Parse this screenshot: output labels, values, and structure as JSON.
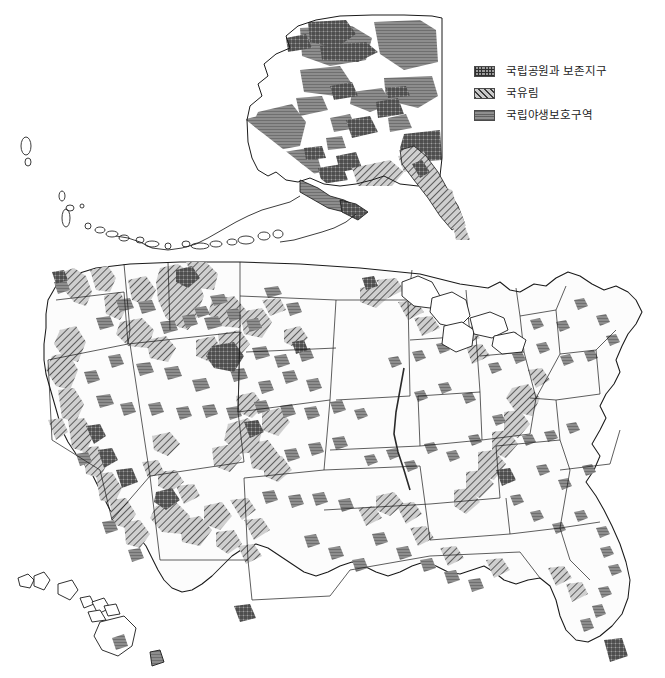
{
  "map": {
    "title": "United States Federal Protected Lands",
    "projection": "albers-conic",
    "background_color": "#ffffff",
    "outline_color": "#1a1a1a",
    "insets": [
      {
        "name": "alaska",
        "label": "Alaska"
      },
      {
        "name": "hawaii",
        "label": "Hawaii"
      },
      {
        "name": "conus",
        "label": "Contiguous United States"
      }
    ]
  },
  "legend": {
    "position": "top-right",
    "items": [
      {
        "key": "national-parks",
        "label": "국립공원과 보존지구",
        "pattern": "crosshatch",
        "swatch_class": "sw-park",
        "fill_color": "#9a9a9a",
        "line_color": "#2e2e2e"
      },
      {
        "key": "national-forests",
        "label": "국유림",
        "pattern": "diagonal-hatch",
        "swatch_class": "sw-forest",
        "fill_color": "#c9c9c9",
        "line_color": "#3a3a3a"
      },
      {
        "key": "national-wildlife-refuges",
        "label": "국립야생보호구역",
        "pattern": "solid-gray",
        "swatch_class": "sw-refuge",
        "fill_color": "#8f8f8f",
        "line_color": "#3c3c3c"
      }
    ]
  },
  "regions": {
    "alaska": {
      "protected_share": "high",
      "dominant_pattern": "solid-gray",
      "notes": "Large refuge and park blocks across interior and north; forest hatching along southeast panhandle."
    },
    "west": {
      "protected_share": "high",
      "dominant_pattern": "diagonal-hatch",
      "notes": "Continuous national forest belts along Cascades, Sierra Nevada and Rocky Mountains."
    },
    "midwest": {
      "protected_share": "low",
      "dominant_pattern": "solid-gray",
      "notes": "Scattered small refuges across the plains; forests near the Great Lakes."
    },
    "east": {
      "protected_share": "moderate",
      "dominant_pattern": "diagonal-hatch",
      "notes": "Appalachian forest corridor from Pennsylvania to Georgia."
    },
    "hawaii": {
      "protected_share": "moderate",
      "dominant_pattern": "solid-gray",
      "notes": "Park areas on the island of Hawaii and Maui."
    }
  }
}
